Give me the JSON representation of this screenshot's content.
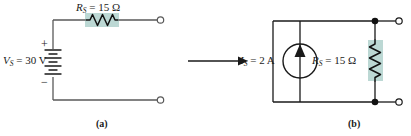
{
  "figure": {
    "background_color": "#ffffff",
    "wire_color": "#595959",
    "wire_color_b": "#1a1a1a",
    "highlight_color": "#bcd8d4",
    "ink_color": "#1a1a1a"
  },
  "circuit_a": {
    "caption": "(a)",
    "resistor": {
      "label_prefix": "R",
      "label_sub": "S",
      "label_value": "= 15 Ω",
      "full_label": "R_S = 15 Ω",
      "orientation": "horizontal",
      "highlighted": true
    },
    "source": {
      "label_prefix": "V",
      "label_sub": "S",
      "label_value": "= 30 V",
      "full_label": "V_S = 30 V",
      "type": "battery",
      "plus_sign": "+",
      "minus_sign": "−"
    },
    "terminals": [
      {
        "name": "top-terminal",
        "type": "open-circle"
      },
      {
        "name": "bottom-terminal",
        "type": "open-circle"
      }
    ]
  },
  "transform_arrow": {
    "name": "equivalence-arrow",
    "direction": "right"
  },
  "circuit_b": {
    "caption": "(b)",
    "source": {
      "label_prefix": "I",
      "label_sub": "S",
      "label_value": "= 2 A",
      "full_label": "I_S = 2 A",
      "type": "current-source",
      "arrow_direction": "up"
    },
    "resistor": {
      "label_prefix": "R",
      "label_sub": "S",
      "label_value": "= 15 Ω",
      "full_label": "R_S = 15 Ω",
      "orientation": "vertical",
      "highlighted": true
    },
    "nodes": [
      {
        "name": "top-node-dot",
        "type": "filled-dot"
      },
      {
        "name": "bottom-node-dot",
        "type": "filled-dot"
      }
    ],
    "terminals": [
      {
        "name": "top-terminal",
        "type": "open-circle"
      },
      {
        "name": "bottom-terminal",
        "type": "open-circle"
      }
    ]
  }
}
